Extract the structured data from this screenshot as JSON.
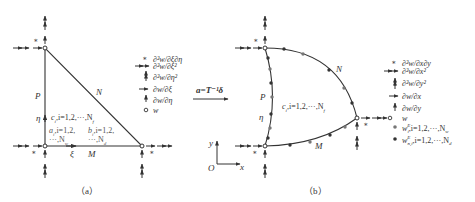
{
  "figure": {
    "colors": {
      "line": "#333333",
      "text": "#333333",
      "background": "#ffffff",
      "dot": "#555555"
    },
    "panel_a": {
      "caption": "（a）",
      "edge_labels": {
        "N": "N",
        "P": "P",
        "M": "M"
      },
      "axis_labels": {
        "eta": "η",
        "xi": "ξ"
      },
      "interior_labels": {
        "c": "c",
        "c_rest": ",i=1,2,···,N",
        "c_sub": "i",
        "c_nsub": "f",
        "a": "a",
        "a_rest": ",i=1,2,",
        "a_sub": "i",
        "a_line2": "···,N",
        "a_nsub": "w",
        "b": "b",
        "b_rest": ",i=1,2,",
        "b_sub": "i",
        "b_line2": "···,N",
        "b_nsub": "d"
      },
      "legend": [
        {
          "symbol": "star",
          "label": "∂²w/∂ξ∂η"
        },
        {
          "symbol": "double-arrow-horizontal",
          "label": "∂²w/∂ξ²"
        },
        {
          "symbol": "double-arrow-vertical",
          "label": "∂²w/∂η²"
        },
        {
          "symbol": "arrow-horizontal",
          "label": "∂w/∂ξ"
        },
        {
          "symbol": "arrow-vertical",
          "label": "∂w/∂η"
        },
        {
          "symbol": "open-circle",
          "label": "w"
        }
      ]
    },
    "transform": {
      "label": "a=T⁻¹δ"
    },
    "panel_b": {
      "caption": "（b）",
      "edge_labels": {
        "N": "N",
        "P": "P",
        "M": "M"
      },
      "axis_labels": {
        "eta": "η",
        "x": "x",
        "y": "y",
        "origin": "O"
      },
      "interior_label": "c",
      "interior_sub": "i",
      "interior_rest": ",i=1,2,···,N",
      "interior_nsub": "f",
      "legend": [
        {
          "symbol": "star",
          "label": "∂²w/∂x∂y"
        },
        {
          "symbol": "double-arrow-horizontal",
          "label": "∂²w/∂x²"
        },
        {
          "symbol": "double-arrow-vertical",
          "label": "∂²w/∂y²"
        },
        {
          "symbol": "arrow-horizontal",
          "label": "∂w/∂x"
        },
        {
          "symbol": "arrow-vertical",
          "label": "∂w/∂y"
        },
        {
          "symbol": "open-circle",
          "label": "w"
        },
        {
          "symbol": "gray-dot",
          "label": "w",
          "sup": "E",
          "sub": "i",
          "rest": ",i=1,2,···,N",
          "nsub": "w"
        },
        {
          "symbol": "black-dot",
          "label": "w",
          "sup": "E",
          "sub": "n,i",
          "rest": ",i=1,2,···,N",
          "nsub": "d"
        }
      ]
    }
  }
}
